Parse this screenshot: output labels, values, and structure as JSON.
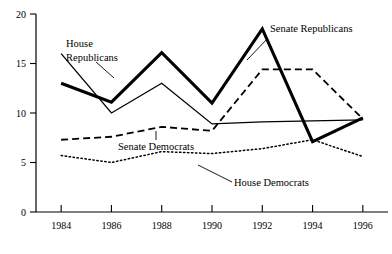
{
  "chart_data": {
    "type": "line",
    "title": "",
    "subtitle": "",
    "xlabel": "",
    "ylabel": "",
    "x": [
      1984,
      1986,
      1988,
      1990,
      1992,
      1994,
      1996
    ],
    "categories": [
      "1984",
      "1986",
      "1988",
      "1990",
      "1992",
      "1994",
      "1996"
    ],
    "xlim": [
      1983,
      1997
    ],
    "ylim": [
      0,
      20
    ],
    "yticks": [
      0,
      5,
      10,
      15,
      20
    ],
    "ytick_labels": [
      "0",
      "5",
      "10",
      "15",
      "20"
    ],
    "xticks": [
      1984,
      1986,
      1988,
      1990,
      1992,
      1994,
      1996
    ],
    "xtick_labels": [
      "1984",
      "1986",
      "1988",
      "1990",
      "1992",
      "1994",
      "1996"
    ],
    "grid": false,
    "legend": "inline-annotations",
    "series": [
      {
        "name": "Senate Republicans",
        "style": "solid-thick",
        "values": [
          13.0,
          11.1,
          16.1,
          11.0,
          18.5,
          7.1,
          9.5
        ]
      },
      {
        "name": "House Republicans",
        "style": "solid-thin",
        "values": [
          16.0,
          10.0,
          13.0,
          8.9,
          9.1,
          9.2,
          9.3
        ]
      },
      {
        "name": "Senate Democrats",
        "style": "dashed",
        "values": [
          7.3,
          7.6,
          8.6,
          8.2,
          14.4,
          14.4,
          9.4
        ]
      },
      {
        "name": "House Democrats",
        "style": "dotted",
        "values": [
          5.7,
          5.0,
          6.1,
          5.9,
          6.4,
          7.3,
          5.6
        ]
      }
    ],
    "annotations": [
      {
        "name": "house-republicans",
        "text_line1": "House",
        "text_line2": "Republicans",
        "text_x": 66,
        "text_y": 47,
        "leader": "M96,62 L114,78"
      },
      {
        "name": "senate-republicans",
        "text_line1": "Senate Republicans",
        "text_line2": "",
        "text_x": 270,
        "text_y": 32,
        "leader": "M268,38 L247,60"
      },
      {
        "name": "senate-democrats",
        "text_line1": "Senate Democrats",
        "text_line2": "",
        "text_x": 118,
        "text_y": 150,
        "leader": "M156,140 L156,131"
      },
      {
        "name": "house-democrats",
        "text_line1": "House Democrats",
        "text_line2": "",
        "text_x": 234,
        "text_y": 186,
        "leader": "M232,182 L198,165"
      }
    ]
  },
  "colors": {
    "axis": "#000000",
    "series": "#000000",
    "background": "#ffffff"
  }
}
